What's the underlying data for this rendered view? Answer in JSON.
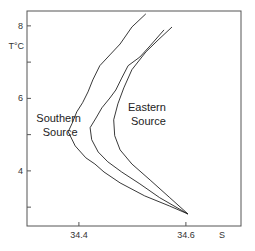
{
  "chart_data": {
    "type": "line",
    "title": "",
    "xlabel": "S",
    "ylabel": "T°C",
    "xlim": [
      34.303,
      34.703
    ],
    "ylim": [
      2.48,
      8.41
    ],
    "grid": false,
    "x_ticks": [
      {
        "value": 34.4,
        "label": "34.4"
      },
      {
        "value": 34.6,
        "label": "34.6"
      }
    ],
    "y_ticks": [
      {
        "value": 8,
        "label": "8"
      },
      {
        "value": 7,
        "label": ""
      },
      {
        "value": 6,
        "label": "6"
      },
      {
        "value": 5,
        "label": ""
      },
      {
        "value": 4,
        "label": "4"
      },
      {
        "value": 3,
        "label": ""
      }
    ],
    "annotations": [
      {
        "lines": [
          "Southern",
          "Source"
        ],
        "x": 34.365,
        "y": 5.35
      },
      {
        "lines": [
          "Eastern",
          "Source"
        ],
        "x": 34.53,
        "y": 5.65
      }
    ],
    "series": [
      {
        "name": "Southern Source profile",
        "color": "#222222",
        "points": [
          [
            34.525,
            8.33
          ],
          [
            34.499,
            7.97
          ],
          [
            34.477,
            7.5
          ],
          [
            34.458,
            7.2
          ],
          [
            34.439,
            6.9
          ],
          [
            34.426,
            6.51
          ],
          [
            34.417,
            6.18
          ],
          [
            34.407,
            5.88
          ],
          [
            34.396,
            5.63
          ],
          [
            34.387,
            5.3
          ],
          [
            34.38,
            5.08
          ],
          [
            34.393,
            4.69
          ],
          [
            34.413,
            4.36
          ],
          [
            34.43,
            4.19
          ],
          [
            34.447,
            3.97
          ],
          [
            34.477,
            3.67
          ],
          [
            34.523,
            3.31
          ],
          [
            34.57,
            3.03
          ],
          [
            34.604,
            2.81
          ]
        ]
      },
      {
        "name": "Intermediate profile",
        "color": "#222222",
        "points": [
          [
            34.559,
            7.89
          ],
          [
            34.533,
            7.45
          ],
          [
            34.514,
            7.14
          ],
          [
            34.492,
            6.9
          ],
          [
            34.48,
            6.56
          ],
          [
            34.469,
            6.23
          ],
          [
            34.458,
            6.01
          ],
          [
            34.443,
            5.74
          ],
          [
            34.432,
            5.46
          ],
          [
            34.421,
            5.19
          ],
          [
            34.424,
            4.86
          ],
          [
            34.436,
            4.52
          ],
          [
            34.454,
            4.25
          ],
          [
            34.48,
            3.97
          ],
          [
            34.514,
            3.64
          ],
          [
            34.551,
            3.26
          ],
          [
            34.604,
            2.81
          ]
        ]
      },
      {
        "name": "Eastern Source profile",
        "color": "#222222",
        "points": [
          [
            34.574,
            7.97
          ],
          [
            34.548,
            7.61
          ],
          [
            34.525,
            7.28
          ],
          [
            34.499,
            6.79
          ],
          [
            34.484,
            6.29
          ],
          [
            34.473,
            5.85
          ],
          [
            34.465,
            5.41
          ],
          [
            34.467,
            4.97
          ],
          [
            34.477,
            4.58
          ],
          [
            34.499,
            4.19
          ],
          [
            34.533,
            3.75
          ],
          [
            34.57,
            3.26
          ],
          [
            34.604,
            2.81
          ]
        ]
      }
    ]
  }
}
